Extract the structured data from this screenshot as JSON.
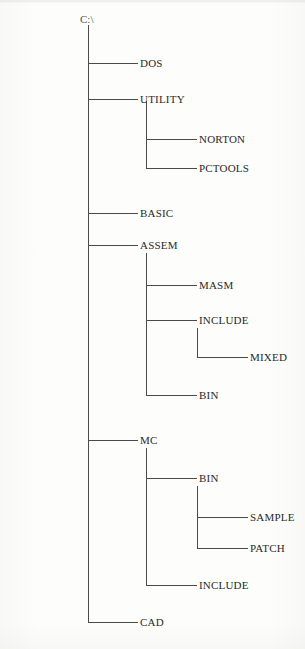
{
  "diagram": {
    "root": {
      "label": "C:\\",
      "x": 80,
      "y": 14
    },
    "trunks": [
      {
        "name": "trunk-root",
        "x": 88,
        "y": 25,
        "height": 598
      },
      {
        "name": "trunk-utility",
        "x": 146,
        "y": 101,
        "height": 68
      },
      {
        "name": "trunk-assem",
        "x": 146,
        "y": 253,
        "height": 143
      },
      {
        "name": "trunk-assem-include",
        "x": 197,
        "y": 328,
        "height": 30
      },
      {
        "name": "trunk-mc",
        "x": 146,
        "y": 448,
        "height": 138
      },
      {
        "name": "trunk-mc-bin",
        "x": 197,
        "y": 486,
        "height": 63
      }
    ],
    "branches": [
      {
        "name": "branch-dos",
        "x": 88,
        "y": 63,
        "width": 50
      },
      {
        "name": "branch-utility",
        "x": 88,
        "y": 99,
        "width": 50
      },
      {
        "name": "branch-norton",
        "x": 146,
        "y": 139,
        "width": 51
      },
      {
        "name": "branch-pctools",
        "x": 146,
        "y": 168,
        "width": 51
      },
      {
        "name": "branch-basic",
        "x": 88,
        "y": 213,
        "width": 50
      },
      {
        "name": "branch-assem",
        "x": 88,
        "y": 245,
        "width": 50
      },
      {
        "name": "branch-masm",
        "x": 146,
        "y": 285,
        "width": 51
      },
      {
        "name": "branch-include",
        "x": 146,
        "y": 320,
        "width": 51
      },
      {
        "name": "branch-mixed",
        "x": 197,
        "y": 357,
        "width": 51
      },
      {
        "name": "branch-bin",
        "x": 146,
        "y": 395,
        "width": 51
      },
      {
        "name": "branch-mc",
        "x": 88,
        "y": 440,
        "width": 50
      },
      {
        "name": "branch-mc-bin",
        "x": 146,
        "y": 478,
        "width": 51
      },
      {
        "name": "branch-sample",
        "x": 197,
        "y": 517,
        "width": 51
      },
      {
        "name": "branch-patch",
        "x": 197,
        "y": 548,
        "width": 51
      },
      {
        "name": "branch-mc-include",
        "x": 146,
        "y": 585,
        "width": 51
      },
      {
        "name": "branch-cad",
        "x": 88,
        "y": 622,
        "width": 50
      }
    ],
    "nodes": [
      {
        "name": "node-dos",
        "label": "DOS",
        "x": 140,
        "y": 58,
        "level": 1
      },
      {
        "name": "node-utility",
        "label": "UTILITY",
        "x": 140,
        "y": 94,
        "level": 1
      },
      {
        "name": "node-norton",
        "label": "NORTON",
        "x": 199,
        "y": 134,
        "level": 2
      },
      {
        "name": "node-pctools",
        "label": "PCTOOLS",
        "x": 199,
        "y": 163,
        "level": 2
      },
      {
        "name": "node-basic",
        "label": "BASIC",
        "x": 140,
        "y": 208,
        "level": 1
      },
      {
        "name": "node-assem",
        "label": "ASSEM",
        "x": 140,
        "y": 240,
        "level": 1
      },
      {
        "name": "node-masm",
        "label": "MASM",
        "x": 199,
        "y": 280,
        "level": 2
      },
      {
        "name": "node-include",
        "label": "INCLUDE",
        "x": 199,
        "y": 315,
        "level": 2
      },
      {
        "name": "node-mixed",
        "label": "MIXED",
        "x": 250,
        "y": 352,
        "level": 3
      },
      {
        "name": "node-bin",
        "label": "BIN",
        "x": 199,
        "y": 390,
        "level": 2
      },
      {
        "name": "node-mc",
        "label": "MC",
        "x": 140,
        "y": 435,
        "level": 1
      },
      {
        "name": "node-mc-bin",
        "label": "BIN",
        "x": 199,
        "y": 473,
        "level": 2
      },
      {
        "name": "node-sample",
        "label": "SAMPLE",
        "x": 250,
        "y": 512,
        "level": 3
      },
      {
        "name": "node-patch",
        "label": "PATCH",
        "x": 250,
        "y": 543,
        "level": 3
      },
      {
        "name": "node-mc-include",
        "label": "INCLUDE",
        "x": 199,
        "y": 580,
        "level": 2
      },
      {
        "name": "node-cad",
        "label": "CAD",
        "x": 140,
        "y": 617,
        "level": 1
      }
    ],
    "colors": {
      "line": "#4a4a48",
      "text": "#2a2a28",
      "background": "#fdfdfb"
    }
  }
}
